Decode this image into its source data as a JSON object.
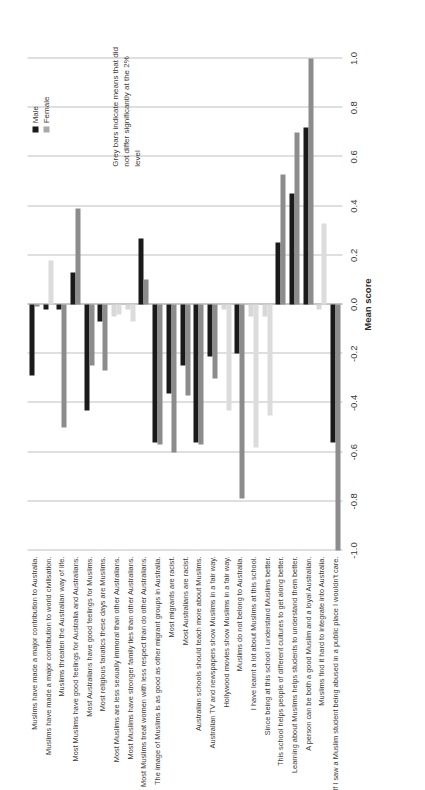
{
  "chart_data": {
    "type": "bar",
    "orientation": "horizontal",
    "title": "",
    "xlabel": "Mean score",
    "ylabel": "",
    "xlim": [
      -1.0,
      1.0
    ],
    "xticks": [
      "-1.0",
      "-0.8",
      "-0.6",
      "-0.4",
      "-0.2",
      "0.0",
      "0.2",
      "0.4",
      "0.6",
      "0.8",
      "1.0"
    ],
    "xtick_values": [
      -1.0,
      -0.8,
      -0.6,
      -0.4,
      -0.2,
      0.0,
      0.2,
      0.4,
      0.6,
      0.8,
      1.0
    ],
    "grid": true,
    "legend_position": "top-right",
    "categories": [
      "Muslims have made a major contribution to Australia.",
      "Muslims have made a major contribution to world civilisation.",
      "Muslims threaten the Australian way of life.",
      "Most Muslims have good feelings for Australia and Australians.",
      "Most Australians have good feelings for Muslims.",
      "Most religious fanatics these days are Muslims.",
      "Most Muslims are less sexually immoral than other Australians.",
      "Most Muslims have stronger family ties than other Australians.",
      "Most Muslims treat women with less respect than do other Australians.",
      "The image of Muslims is as good as other migrant groups in Australia.",
      "Most migrants are racist.",
      "Most Australians are racist.",
      "Australian schools should teach more about Muslims.",
      "Australian TV and newspapers show Muslims in a fair way.",
      "Hollywood movies show Muslims in a fair way.",
      "Muslims do not belong to Australia.",
      "I have learnt a lot about Muslims at this school.",
      "Since being at this school I understand Muslims better.",
      "This school helps people of different cultures to get along better.",
      "Learning about Muslims helps students to understand them better.",
      "A person can be both a good Muslim and a loyal Australian.",
      "Muslims find it hard to integrate into Australia.",
      "If I saw a Muslim student being abused in a public place I wouldn't care."
    ],
    "series": [
      {
        "name": "Male",
        "color": "#1a1a1a",
        "values": [
          -0.29,
          -0.02,
          -0.02,
          0.13,
          -0.43,
          -0.07,
          -0.05,
          -0.02,
          0.27,
          -0.56,
          -0.36,
          -0.25,
          -0.56,
          -0.21,
          -0.02,
          -0.2,
          -0.05,
          -0.05,
          0.25,
          0.45,
          0.72,
          -0.02,
          -0.56
        ],
        "nonsignificant": [
          false,
          false,
          false,
          false,
          false,
          false,
          true,
          true,
          false,
          false,
          false,
          false,
          false,
          false,
          true,
          false,
          true,
          true,
          false,
          false,
          false,
          true,
          false
        ]
      },
      {
        "name": "Female",
        "color": "#8c8c8c",
        "values": [
          -0.01,
          0.18,
          -0.5,
          0.39,
          -0.25,
          -0.27,
          -0.04,
          -0.07,
          0.1,
          -0.57,
          -0.6,
          -0.37,
          -0.57,
          -0.3,
          -0.43,
          -0.79,
          -0.58,
          -0.45,
          0.53,
          0.7,
          1.0,
          0.33,
          -1.0
        ],
        "nonsignificant": [
          false,
          true,
          false,
          false,
          false,
          false,
          true,
          true,
          false,
          false,
          false,
          false,
          false,
          false,
          true,
          false,
          true,
          true,
          false,
          false,
          false,
          true,
          false
        ]
      }
    ],
    "legend": [
      "Male",
      "Female"
    ],
    "annotation": "Grey bars indicate means that did not differ significantly at the 2% level",
    "colors": {
      "male": "#1a1a1a",
      "female": "#8c8c8c",
      "nonsignificant": "#d8d8d8",
      "gridline": "#bfbfbf",
      "background": "#ffffff"
    }
  }
}
